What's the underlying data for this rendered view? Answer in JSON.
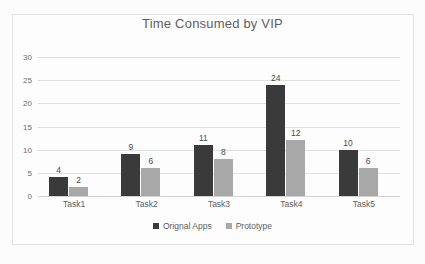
{
  "chart_data": {
    "type": "bar",
    "title": "Time Consumed by VIP",
    "xlabel": "",
    "ylabel": "",
    "categories": [
      "Task1",
      "Task2",
      "Task3",
      "Task4",
      "Task5"
    ],
    "series": [
      {
        "name": "Orignal Apps",
        "color": "#3a3a3a",
        "values": [
          4,
          9,
          11,
          24,
          10
        ]
      },
      {
        "name": "Prototype",
        "color": "#a8a8a8",
        "values": [
          2,
          6,
          8,
          12,
          6
        ]
      }
    ],
    "ylim": [
      0,
      30
    ],
    "yticks": [
      0,
      5,
      10,
      15,
      20,
      25,
      30
    ],
    "ytick_labels": [
      "0",
      "5",
      "10",
      "15",
      "20",
      "25",
      "30"
    ],
    "grid": "horizontal",
    "legend_position": "bottom",
    "data_labels": true
  }
}
